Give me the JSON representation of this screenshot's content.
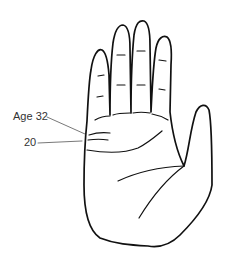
{
  "diagram": {
    "annotations": [
      {
        "id": "age32",
        "text": "Age 32"
      },
      {
        "id": "age20",
        "text": "20"
      }
    ],
    "colors": {
      "background": "#ffffff",
      "stroke": "#111111",
      "leader": "#555555",
      "label": "#333333"
    }
  }
}
